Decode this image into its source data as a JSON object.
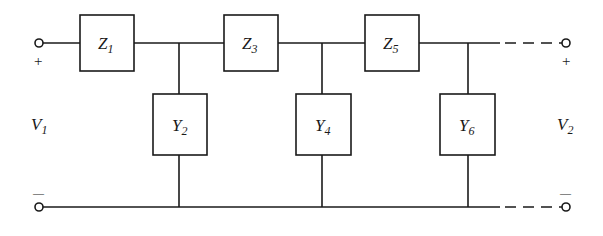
{
  "diagram": {
    "series_elements": [
      {
        "id": "Z1",
        "symbol": "Z",
        "subscript": "1"
      },
      {
        "id": "Z3",
        "symbol": "Z",
        "subscript": "3"
      },
      {
        "id": "Z5",
        "symbol": "Z",
        "subscript": "5"
      }
    ],
    "shunt_elements": [
      {
        "id": "Y2",
        "symbol": "Y",
        "subscript": "2"
      },
      {
        "id": "Y4",
        "symbol": "Y",
        "subscript": "4"
      },
      {
        "id": "Y6",
        "symbol": "Y",
        "subscript": "6"
      }
    ],
    "ports": {
      "input": {
        "symbol": "V",
        "subscript": "1",
        "plus": "+",
        "minus": "—"
      },
      "output": {
        "symbol": "V",
        "subscript": "2",
        "plus": "+",
        "minus": "—"
      }
    },
    "colors": {
      "line": "#1a1a1a",
      "background": "#ffffff"
    }
  }
}
